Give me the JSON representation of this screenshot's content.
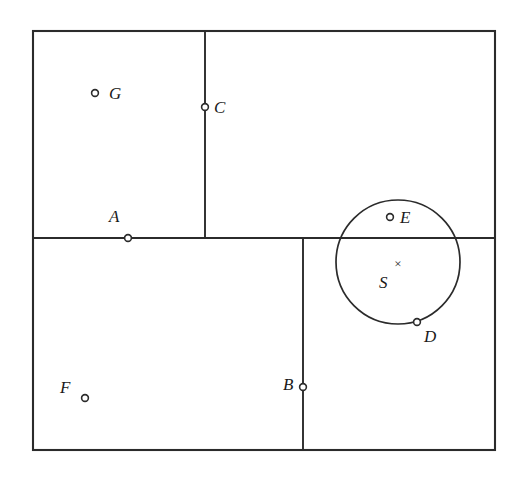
{
  "figure": {
    "background_color": "#ffffff",
    "stroke_color": "#2b2b2b",
    "label_color": "#1a1a1a",
    "canvas": {
      "width": 516,
      "height": 482
    },
    "outer_rectangle": {
      "x": 33,
      "y": 31,
      "width": 462,
      "height": 419
    },
    "dividers": [
      {
        "name": "horizontal-divider",
        "orientation": "horizontal",
        "x1": 33,
        "y1": 238,
        "x2": 495,
        "y2": 238
      },
      {
        "name": "upper-vertical-divider",
        "orientation": "vertical",
        "x1": 205,
        "y1": 31,
        "x2": 205,
        "y2": 238
      },
      {
        "name": "lower-vertical-divider",
        "orientation": "vertical",
        "x1": 303,
        "y1": 238,
        "x2": 303,
        "y2": 450
      }
    ],
    "circle": {
      "name": "circle-S",
      "cx": 398,
      "cy": 262,
      "r": 62
    },
    "center_marker": {
      "name": "center-cross",
      "glyph": "×",
      "cx": 398,
      "cy": 264
    },
    "points": [
      {
        "id": "G",
        "label": "G",
        "cx": 95,
        "cy": 93,
        "marker": "open-circle",
        "label_x": 109,
        "label_y": 85,
        "on": "interior-top-left"
      },
      {
        "id": "C",
        "label": "C",
        "cx": 205,
        "cy": 107,
        "marker": "open-circle",
        "label_x": 214,
        "label_y": 99,
        "on": "upper-vertical-divider"
      },
      {
        "id": "A",
        "label": "A",
        "cx": 128,
        "cy": 238,
        "marker": "open-circle",
        "label_x": 109,
        "label_y": 208,
        "on": "horizontal-divider"
      },
      {
        "id": "E",
        "label": "E",
        "cx": 390,
        "cy": 217,
        "marker": "open-circle",
        "label_x": 400,
        "label_y": 209,
        "on": "circle-interior"
      },
      {
        "id": "D",
        "label": "D",
        "cx": 417,
        "cy": 322,
        "marker": "open-circle",
        "label_x": 424,
        "label_y": 328,
        "on": "circle-boundary"
      },
      {
        "id": "B",
        "label": "B",
        "cx": 303,
        "cy": 387,
        "marker": "open-circle",
        "label_x": 283,
        "label_y": 376,
        "on": "lower-vertical-divider"
      },
      {
        "id": "F",
        "label": "F",
        "cx": 85,
        "cy": 398,
        "marker": "open-circle",
        "label_x": 60,
        "label_y": 379,
        "on": "interior-bottom-left"
      },
      {
        "id": "S",
        "label": "S",
        "cx": 398,
        "cy": 264,
        "marker": "cross",
        "label_x": 379,
        "label_y": 274,
        "on": "circle-center"
      }
    ],
    "caption": ""
  }
}
